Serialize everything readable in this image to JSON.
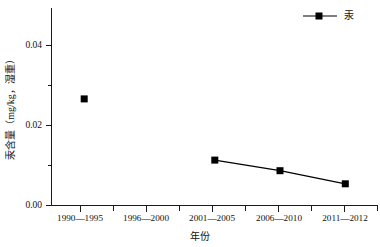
{
  "chart_data": {
    "type": "line",
    "title": "",
    "xlabel": "年份",
    "ylabel": "汞含量（mg/kg，湿重）",
    "categories": [
      "1990—1995",
      "1996—2000",
      "2001—2005",
      "2006—2010",
      "2011—2012"
    ],
    "series": [
      {
        "name": "汞",
        "values": [
          0.027,
          null,
          0.0115,
          0.0088,
          0.0055
        ],
        "color": "#000000",
        "marker": "square",
        "connected_from_index": 2
      }
    ],
    "ylim": [
      0.0,
      0.05
    ],
    "ytick_values": [
      0.0,
      0.02,
      0.04
    ],
    "ytick_labels": [
      "0.00",
      "0.02",
      "0.04"
    ],
    "yminor_tick_values": [
      0.01,
      0.03
    ],
    "grid": false,
    "legend_position": "top-right",
    "legend_entries": [
      "汞"
    ],
    "axis_style": "left-bottom-only"
  },
  "axes": {
    "y_label": "汞含量（mg/kg，湿重）",
    "x_label": "年份",
    "y_ticks": [
      "0.04",
      "0.02",
      "0.00"
    ],
    "x_ticks": [
      "1990—1995",
      "1996—2000",
      "2001—2005",
      "2006—2010",
      "2011—2012"
    ]
  },
  "legend": {
    "entry_label": "汞"
  },
  "colors": {
    "series": "#000000",
    "axis": "#1a1a1a",
    "background": "#ffffff"
  }
}
